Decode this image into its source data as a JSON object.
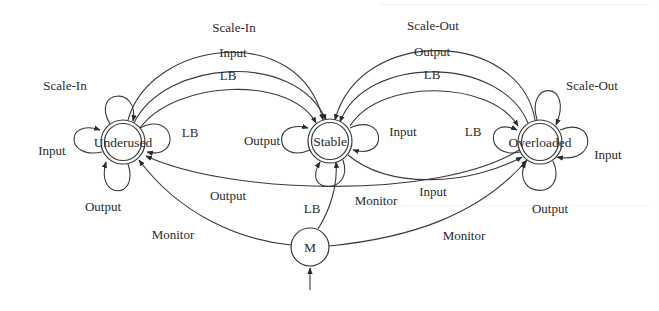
{
  "diagram": {
    "title": "",
    "nodes": [
      {
        "id": "underused",
        "label": "Underused",
        "x": 123,
        "y": 142,
        "r": 22,
        "double": true
      },
      {
        "id": "stable",
        "label": "Stable",
        "x": 330,
        "y": 141,
        "r": 22,
        "double": true
      },
      {
        "id": "overloaded",
        "label": "Overloaded",
        "x": 540,
        "y": 142,
        "r": 22,
        "double": true
      },
      {
        "id": "monitor",
        "label": "M",
        "x": 310,
        "y": 247,
        "r": 19,
        "double": false
      }
    ],
    "edges": [
      {
        "from": "underused",
        "to": "stable",
        "label": "Scale-In"
      },
      {
        "from": "underused",
        "to": "stable",
        "label": "Input"
      },
      {
        "from": "underused",
        "to": "stable",
        "label": "LB"
      },
      {
        "from": "overloaded",
        "to": "stable",
        "label": "Scale-Out"
      },
      {
        "from": "overloaded",
        "to": "stable",
        "label": "Output"
      },
      {
        "from": "stable",
        "to": "overloaded",
        "label": "LB"
      },
      {
        "from": "overloaded",
        "to": "underused",
        "label": "Output"
      },
      {
        "from": "stable",
        "to": "overloaded",
        "label": "Input"
      },
      {
        "from": "monitor",
        "to": "underused",
        "label": "Monitor"
      },
      {
        "from": "monitor",
        "to": "stable",
        "label": "Monitor"
      },
      {
        "from": "monitor",
        "to": "overloaded",
        "label": "Monitor"
      },
      {
        "from": "underused",
        "to": "underused",
        "label": "Scale-In"
      },
      {
        "from": "underused",
        "to": "underused",
        "label": "Input"
      },
      {
        "from": "underused",
        "to": "underused",
        "label": "LB"
      },
      {
        "from": "underused",
        "to": "underused",
        "label": "Output"
      },
      {
        "from": "stable",
        "to": "stable",
        "label": "Output"
      },
      {
        "from": "stable",
        "to": "stable",
        "label": "Input"
      },
      {
        "from": "stable",
        "to": "stable",
        "label": "LB"
      },
      {
        "from": "overloaded",
        "to": "overloaded",
        "label": "Scale-Out"
      },
      {
        "from": "overloaded",
        "to": "overloaded",
        "label": "LB"
      },
      {
        "from": "overloaded",
        "to": "overloaded",
        "label": "Input"
      },
      {
        "from": "overloaded",
        "to": "overloaded",
        "label": "Output"
      }
    ],
    "labels": {
      "top_scale_in": "Scale-In",
      "top_input": "Input",
      "top_lb_left": "LB",
      "top_scale_out": "Scale-Out",
      "top_output": "Output",
      "top_lb_right": "LB",
      "u_loop_scale_in": "Scale-In",
      "u_loop_input": "Input",
      "u_loop_lb": "LB",
      "u_loop_output": "Output",
      "s_loop_output": "Output",
      "s_loop_input": "Input",
      "s_loop_lb": "LB",
      "o_loop_scale_out": "Scale-Out",
      "o_loop_lb": "LB",
      "o_loop_input": "Input",
      "o_loop_output": "Output",
      "mid_output": "Output",
      "mid_input": "Input",
      "monitor_left": "Monitor",
      "monitor_mid": "Monitor",
      "monitor_right": "Monitor"
    },
    "colors": {
      "stroke": "#3a3a3a",
      "text": "#2a2a2a",
      "background": "#ffffff"
    }
  }
}
